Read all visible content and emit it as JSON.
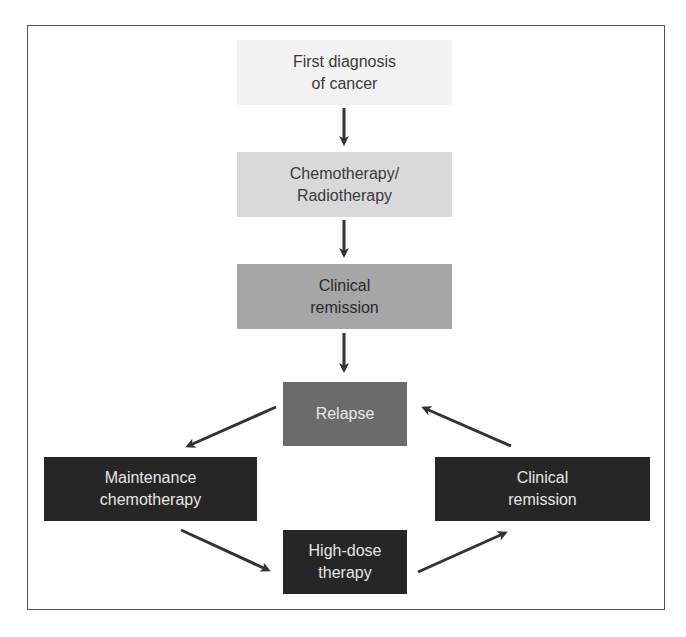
{
  "diagram": {
    "nodes": [
      {
        "id": "first-diagnosis",
        "label": "First diagnosis\nof cancer",
        "fill": "#f2f2f2",
        "text": "#3a3a3a"
      },
      {
        "id": "chemo-radio",
        "label": "Chemotherapy/\nRadiotherapy",
        "fill": "#d9d9d9",
        "text": "#3a3a3a"
      },
      {
        "id": "clinical-remission-1",
        "label": "Clinical\nremission",
        "fill": "#a6a6a6",
        "text": "#2a2a2a"
      },
      {
        "id": "relapse",
        "label": "Relapse",
        "fill": "#6b6b6b",
        "text": "#e8e8e8"
      },
      {
        "id": "maintenance-chemo",
        "label": "Maintenance\nchemotherapy",
        "fill": "#262626",
        "text": "#e6e6e6"
      },
      {
        "id": "clinical-remission-2",
        "label": "Clinical\nremission",
        "fill": "#262626",
        "text": "#e6e6e6"
      },
      {
        "id": "high-dose-therapy",
        "label": "High-dose\ntherapy",
        "fill": "#262626",
        "text": "#e6e6e6"
      }
    ],
    "edges": [
      {
        "from": "first-diagnosis",
        "to": "chemo-radio"
      },
      {
        "from": "chemo-radio",
        "to": "clinical-remission-1"
      },
      {
        "from": "clinical-remission-1",
        "to": "relapse"
      },
      {
        "from": "relapse",
        "to": "maintenance-chemo"
      },
      {
        "from": "maintenance-chemo",
        "to": "high-dose-therapy"
      },
      {
        "from": "high-dose-therapy",
        "to": "clinical-remission-2"
      },
      {
        "from": "clinical-remission-2",
        "to": "relapse"
      }
    ],
    "arrow_color": "#333333",
    "frame_color": "#555555"
  }
}
